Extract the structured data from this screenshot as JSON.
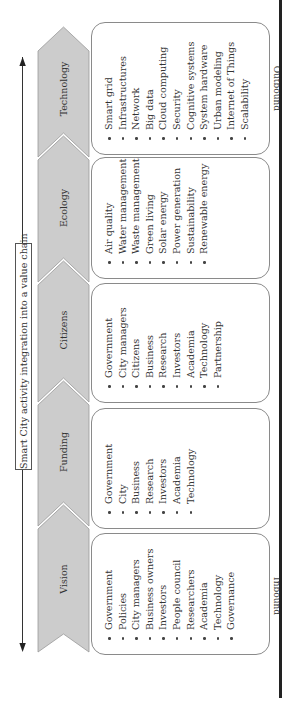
{
  "diagram": {
    "title": "Smart City activity integration into a value chain",
    "inbound_label": "Inbound",
    "outbound_label": "Outbound",
    "orientation": "rotated 90 degrees counter-clockwise (reads bottom to top)",
    "colors": {
      "chevron_fill": "#cccccc",
      "chevron_stroke": "#999999",
      "box_border": "#8a8a8a",
      "text": "#333333",
      "rule": "#222222"
    },
    "stages": [
      {
        "label": "Vision",
        "items": [
          "Government",
          "Policies",
          "City managers",
          "Business owners",
          "Investors",
          "People council",
          "Researchers",
          "Academia",
          "Technology",
          "Governance"
        ]
      },
      {
        "label": "Funding",
        "items": [
          "Government",
          "City",
          "Business",
          "Research",
          "Investors",
          "Academia",
          "Technology"
        ]
      },
      {
        "label": "Citizens",
        "items": [
          "Government",
          "City managers",
          "Citizens",
          "Business",
          "Research",
          "Investors",
          "Academia",
          "Technology",
          "Partnership"
        ]
      },
      {
        "label": "Ecology",
        "items": [
          "Air quality",
          "Water management",
          "Waste management",
          "Green living",
          "Solar energy",
          "Power generation",
          "Sustainability",
          "Renewable energy"
        ]
      },
      {
        "label": "Technology",
        "items": [
          "Smart grid",
          "Infrastructures",
          "Network",
          "Big data",
          "Cloud computing",
          "Security",
          "Cognitive systems",
          "System hardware",
          "Urban modeling",
          "Internet of Things",
          "Scalability"
        ]
      }
    ]
  }
}
